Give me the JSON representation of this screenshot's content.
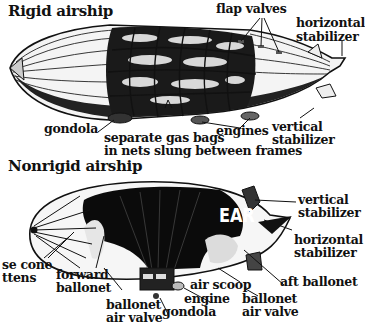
{
  "rigid": {
    "title": "Rigid airship",
    "labels": {
      "flap_valves": "flap valves",
      "horizontal_stabilizer_1": "horizontal",
      "horizontal_stabilizer_2": "stabilizer",
      "gondola": "gondola",
      "gas_bags_1": "separate gas bags",
      "gas_bags_2": "in nets slung between frames",
      "engines": "engines",
      "vertical_stabilizer_1": "vertical",
      "vertical_stabilizer_2": "stabilizer"
    }
  },
  "nonrigid": {
    "title": "Nonrigid airship",
    "hull_lettering": "EAR",
    "labels": {
      "vertical_stabilizer_1": "vertical",
      "vertical_stabilizer_2": "stabilizer",
      "horizontal_stabilizer_1": "horizontal",
      "horizontal_stabilizer_2": "stabilizer",
      "nose_cone_1": "se cone",
      "nose_cone_2": "ttens",
      "forward_ballonet_1": "forward",
      "forward_ballonet_2": "ballonet",
      "aft_ballonet": "aft ballonet",
      "air_scoop": "air scoop",
      "engine": "engine",
      "gondola": "gondola",
      "ballonet_air_valve_left_1": "ballonet",
      "ballonet_air_valve_left_2": "air valve",
      "ballonet_air_valve_right_1": "ballonet",
      "ballonet_air_valve_right_2": "air valve"
    }
  }
}
